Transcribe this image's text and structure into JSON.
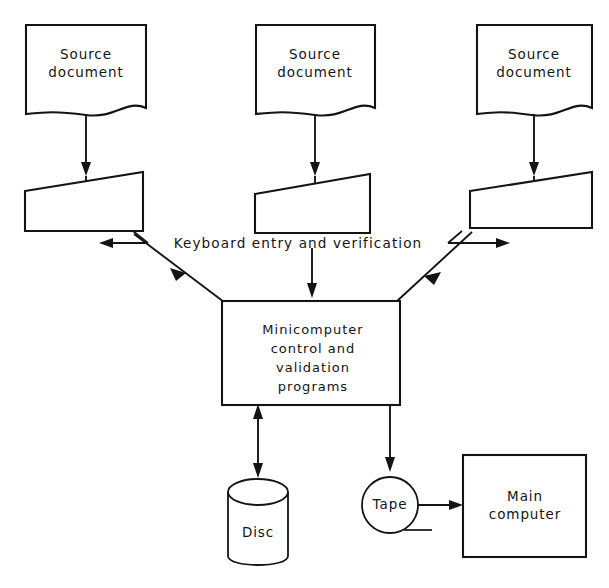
{
  "figure": {
    "title_fragment": "",
    "background_color": "#ffffff",
    "line_color": "#141414"
  },
  "nodes": {
    "source_documents": [
      {
        "id": "source-document-1",
        "line1": "Source",
        "line2": "document",
        "shape": "document"
      },
      {
        "id": "source-document-2",
        "line1": "Source",
        "line2": "document",
        "shape": "document"
      },
      {
        "id": "source-document-3",
        "line1": "Source",
        "line2": "document",
        "shape": "document"
      }
    ],
    "key_stations": [
      {
        "id": "key-station-1",
        "label": "",
        "shape": "trapezoid-keyboard"
      },
      {
        "id": "key-station-2",
        "label": "",
        "shape": "trapezoid-keyboard"
      },
      {
        "id": "key-station-3",
        "label": "",
        "shape": "trapezoid-keyboard"
      }
    ],
    "minicomputer": {
      "id": "minicomputer-process",
      "lines": [
        "Minicomputer",
        "control  and",
        "validation",
        "programs"
      ],
      "shape": "rectangle"
    },
    "disc": {
      "id": "disc-store",
      "label": "Disc",
      "shape": "cylinder"
    },
    "tape": {
      "id": "tape-store",
      "label": "Tape",
      "shape": "circle"
    },
    "main_computer": {
      "id": "main-computer",
      "lines": [
        "Main",
        "computer"
      ],
      "shape": "rectangle"
    }
  },
  "connectors": {
    "keyboard_label": "Keyboard entry and verification",
    "edges": [
      {
        "from": "source-document-1",
        "to": "key-station-1",
        "arrow": "down"
      },
      {
        "from": "source-document-2",
        "to": "key-station-2",
        "arrow": "down"
      },
      {
        "from": "source-document-3",
        "to": "key-station-3",
        "arrow": "down"
      },
      {
        "from": "key-station-1",
        "to": "minicomputer-process",
        "arrow": "to-minicomputer"
      },
      {
        "from": "key-station-2",
        "to": "minicomputer-process",
        "arrow": "down"
      },
      {
        "from": "key-station-3",
        "to": "minicomputer-process",
        "arrow": "to-key-station"
      },
      {
        "from": "minicomputer-process",
        "to": "disc-store",
        "arrow": "bidirectional"
      },
      {
        "from": "minicomputer-process",
        "to": "tape-store",
        "arrow": "down"
      },
      {
        "from": "tape-store",
        "to": "main-computer",
        "arrow": "right"
      }
    ]
  }
}
